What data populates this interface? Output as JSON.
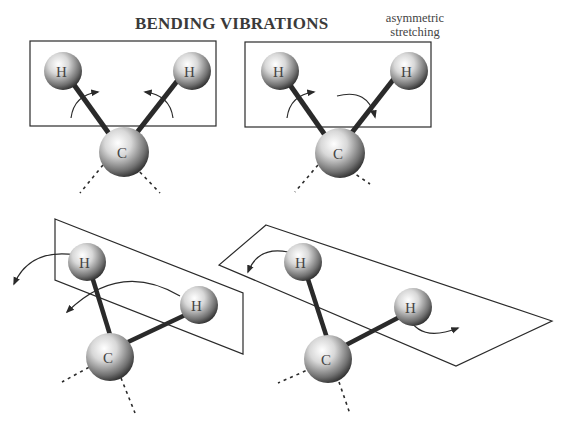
{
  "diagram": {
    "title": "BENDING VIBRATIONS",
    "subtitle_line1": "asymmetric",
    "subtitle_line2": "stretching",
    "atoms": {
      "hydrogen": "H",
      "carbon": "C"
    },
    "panels": [
      {
        "name": "scissoring",
        "plane": "in-plane",
        "motion": "H atoms rotate toward each other"
      },
      {
        "name": "rocking",
        "plane": "in-plane",
        "motion": "H atoms rotate in same direction"
      },
      {
        "name": "wagging",
        "plane": "out-of-plane",
        "motion": "H atoms move out of plane in same direction"
      },
      {
        "name": "twisting",
        "plane": "out-of-plane",
        "motion": "H atoms move out of plane in opposite directions"
      }
    ],
    "colors": {
      "line": "#2a2a2a",
      "atom_dark": "#1a1a1a",
      "atom_light": "#f5f5f5",
      "text": "#3a3a3a"
    }
  }
}
